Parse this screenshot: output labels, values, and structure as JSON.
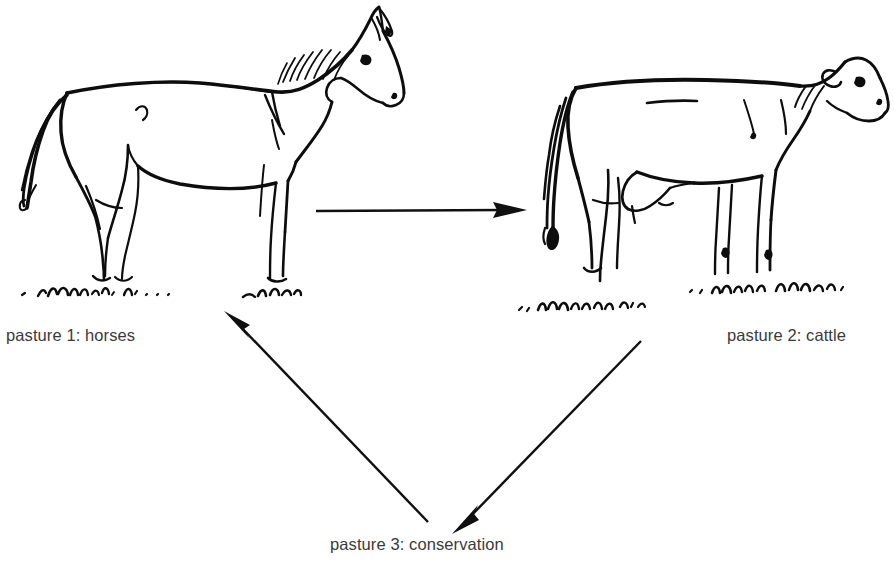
{
  "diagram": {
    "background_color": "#ffffff",
    "ink_color": "#0d0d0d",
    "caption_color": "#3a3a3a",
    "width": 894,
    "height": 561
  },
  "nodes": [
    {
      "id": "pasture-1",
      "label": "pasture 1: horses",
      "illustration": "horse-sketch",
      "position": "top-left"
    },
    {
      "id": "pasture-2",
      "label": "pasture 2: cattle",
      "illustration": "cow-sketch",
      "position": "top-right"
    },
    {
      "id": "pasture-3",
      "label": "pasture 3: conservation",
      "illustration": "none",
      "position": "bottom-center"
    }
  ],
  "arrows": [
    {
      "id": "arrow-horses-to-cattle",
      "from": "pasture-1",
      "to": "pasture-2",
      "direction": "right",
      "label": ""
    },
    {
      "id": "arrow-cattle-to-conservation",
      "from": "pasture-2",
      "to": "pasture-3",
      "direction": "down-left",
      "label": ""
    },
    {
      "id": "arrow-conservation-to-horses",
      "from": "pasture-3",
      "to": "pasture-1",
      "direction": "up-left",
      "label": ""
    }
  ]
}
